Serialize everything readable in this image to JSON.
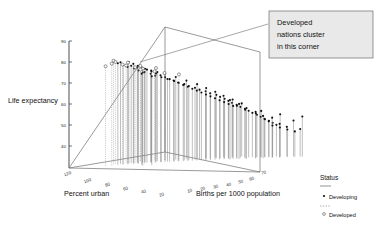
{
  "chart_data": {
    "type": "scatter",
    "subtype": "3d-spike-scatter",
    "title": "",
    "xlabel": "Births per 1000 population",
    "ylabel": "Life expectancy",
    "zlabel": "Percent urban",
    "grid": false,
    "axes": {
      "life_expectancy": {
        "label": "Life expectancy",
        "ticks": [
          90,
          80,
          70,
          60,
          50,
          40,
          30
        ],
        "range": [
          30,
          90
        ]
      },
      "percent_urban": {
        "label": "Percent urban",
        "ticks": [
          120,
          100,
          80,
          60,
          40,
          20
        ],
        "range": [
          0,
          120
        ]
      },
      "births_per_1000": {
        "label": "Births per 1000 population",
        "ticks": [
          10,
          20,
          30,
          40,
          50,
          60,
          70
        ],
        "range": [
          5,
          70
        ]
      }
    },
    "legend": {
      "position": "right",
      "title": "Status",
      "entries": [
        {
          "name": "Developing",
          "marker": "filled-dot",
          "line": "solid",
          "color": "#111111"
        },
        {
          "name": "Developed",
          "marker": "open-circle",
          "line": "dashed",
          "color": "#333333"
        }
      ]
    },
    "annotations": [
      {
        "text": "Developed nations cluster in this corner",
        "target_x": 140,
        "target_y": 62
      }
    ],
    "series": [
      {
        "name": "Developed",
        "marker": "open-circle",
        "points": [
          {
            "births": 13,
            "urban": 96,
            "life": 78
          },
          {
            "births": 12,
            "urban": 90,
            "life": 79
          },
          {
            "births": 14,
            "urban": 86,
            "life": 77
          },
          {
            "births": 11,
            "urban": 84,
            "life": 78
          },
          {
            "births": 13,
            "urban": 78,
            "life": 76
          },
          {
            "births": 15,
            "urban": 74,
            "life": 75
          },
          {
            "births": 12,
            "urban": 72,
            "life": 77
          },
          {
            "births": 16,
            "urban": 68,
            "life": 74
          },
          {
            "births": 14,
            "urban": 64,
            "life": 75
          },
          {
            "births": 13,
            "urban": 60,
            "life": 73
          },
          {
            "births": 17,
            "urban": 57,
            "life": 72
          },
          {
            "births": 12,
            "urban": 100,
            "life": 77
          },
          {
            "births": 19,
            "urban": 52,
            "life": 71
          },
          {
            "births": 15,
            "urban": 48,
            "life": 73
          },
          {
            "births": 22,
            "urban": 45,
            "life": 70
          }
        ]
      },
      {
        "name": "Developing",
        "marker": "filled-dot",
        "points": [
          {
            "births": 14,
            "urban": 92,
            "life": 78
          },
          {
            "births": 15,
            "urban": 89,
            "life": 77
          },
          {
            "births": 16,
            "urban": 87,
            "life": 76
          },
          {
            "births": 13,
            "urban": 85,
            "life": 78
          },
          {
            "births": 17,
            "urban": 83,
            "life": 75
          },
          {
            "births": 18,
            "urban": 81,
            "life": 74
          },
          {
            "births": 15,
            "urban": 79,
            "life": 76
          },
          {
            "births": 19,
            "urban": 77,
            "life": 73
          },
          {
            "births": 16,
            "urban": 75,
            "life": 75
          },
          {
            "births": 20,
            "urban": 73,
            "life": 72
          },
          {
            "births": 21,
            "urban": 71,
            "life": 71
          },
          {
            "births": 17,
            "urban": 69,
            "life": 74
          },
          {
            "births": 22,
            "urban": 67,
            "life": 70
          },
          {
            "births": 18,
            "urban": 65,
            "life": 73
          },
          {
            "births": 23,
            "urban": 63,
            "life": 69
          },
          {
            "births": 19,
            "urban": 61,
            "life": 72
          },
          {
            "births": 24,
            "urban": 59,
            "life": 68
          },
          {
            "births": 25,
            "urban": 57,
            "life": 67
          },
          {
            "births": 20,
            "urban": 55,
            "life": 71
          },
          {
            "births": 26,
            "urban": 53,
            "life": 66
          },
          {
            "births": 27,
            "urban": 51,
            "life": 65
          },
          {
            "births": 22,
            "urban": 49,
            "life": 69
          },
          {
            "births": 28,
            "urban": 47,
            "life": 64
          },
          {
            "births": 29,
            "urban": 45,
            "life": 63
          },
          {
            "births": 24,
            "urban": 43,
            "life": 67
          },
          {
            "births": 30,
            "urban": 41,
            "life": 62
          },
          {
            "births": 31,
            "urban": 39,
            "life": 61
          },
          {
            "births": 26,
            "urban": 37,
            "life": 65
          },
          {
            "births": 32,
            "urban": 35,
            "life": 60
          },
          {
            "births": 33,
            "urban": 34,
            "life": 59
          },
          {
            "births": 28,
            "urban": 33,
            "life": 63
          },
          {
            "births": 34,
            "urban": 32,
            "life": 58
          },
          {
            "births": 35,
            "urban": 31,
            "life": 57
          },
          {
            "births": 36,
            "urban": 30,
            "life": 56
          },
          {
            "births": 30,
            "urban": 29,
            "life": 61
          },
          {
            "births": 37,
            "urban": 28,
            "life": 55
          },
          {
            "births": 38,
            "urban": 27,
            "life": 54
          },
          {
            "births": 32,
            "urban": 26,
            "life": 59
          },
          {
            "births": 39,
            "urban": 25,
            "life": 53
          },
          {
            "births": 40,
            "urban": 24,
            "life": 52
          },
          {
            "births": 41,
            "urban": 23,
            "life": 51
          },
          {
            "births": 34,
            "urban": 22,
            "life": 57
          },
          {
            "births": 42,
            "urban": 21,
            "life": 50
          },
          {
            "births": 43,
            "urban": 20,
            "life": 49
          },
          {
            "births": 44,
            "urban": 19,
            "life": 48
          },
          {
            "births": 36,
            "urban": 18,
            "life": 55
          },
          {
            "births": 45,
            "urban": 17,
            "life": 47
          },
          {
            "births": 46,
            "urban": 16,
            "life": 46
          },
          {
            "births": 47,
            "urban": 15,
            "life": 45
          },
          {
            "births": 48,
            "urban": 14,
            "life": 50
          },
          {
            "births": 50,
            "urban": 13,
            "life": 44
          },
          {
            "births": 52,
            "urban": 12,
            "life": 47
          },
          {
            "births": 54,
            "urban": 11,
            "life": 43
          },
          {
            "births": 38,
            "urban": 40,
            "life": 58
          },
          {
            "births": 40,
            "urban": 36,
            "life": 56
          },
          {
            "births": 42,
            "urban": 34,
            "life": 54
          },
          {
            "births": 44,
            "urban": 30,
            "life": 52
          },
          {
            "births": 46,
            "urban": 28,
            "life": 50
          },
          {
            "births": 48,
            "urban": 24,
            "life": 49
          },
          {
            "births": 50,
            "urban": 22,
            "life": 46
          },
          {
            "births": 25,
            "urban": 62,
            "life": 68
          },
          {
            "births": 27,
            "urban": 58,
            "life": 66
          },
          {
            "births": 29,
            "urban": 54,
            "life": 64
          },
          {
            "births": 31,
            "urban": 50,
            "life": 62
          },
          {
            "births": 33,
            "urban": 46,
            "life": 60
          },
          {
            "births": 35,
            "urban": 42,
            "life": 58
          },
          {
            "births": 37,
            "urban": 38,
            "life": 56
          },
          {
            "births": 23,
            "urban": 66,
            "life": 70
          },
          {
            "births": 21,
            "urban": 70,
            "life": 72
          },
          {
            "births": 19,
            "urban": 74,
            "life": 74
          },
          {
            "births": 43,
            "urban": 26,
            "life": 51
          },
          {
            "births": 45,
            "urban": 22,
            "life": 48
          },
          {
            "births": 47,
            "urban": 20,
            "life": 45
          },
          {
            "births": 49,
            "urban": 18,
            "life": 44
          },
          {
            "births": 51,
            "urban": 16,
            "life": 43
          },
          {
            "births": 53,
            "urban": 14,
            "life": 42
          },
          {
            "births": 55,
            "urban": 12,
            "life": 49
          },
          {
            "births": 41,
            "urban": 32,
            "life": 53
          },
          {
            "births": 39,
            "urban": 35,
            "life": 55
          },
          {
            "births": 28,
            "urban": 56,
            "life": 65
          },
          {
            "births": 26,
            "urban": 60,
            "life": 67
          },
          {
            "births": 24,
            "urban": 64,
            "life": 69
          },
          {
            "births": 22,
            "urban": 68,
            "life": 71
          },
          {
            "births": 20,
            "urban": 72,
            "life": 73
          },
          {
            "births": 18,
            "urban": 76,
            "life": 75
          },
          {
            "births": 16,
            "urban": 80,
            "life": 77
          },
          {
            "births": 15,
            "urban": 82,
            "life": 78
          },
          {
            "births": 17,
            "urban": 78,
            "life": 76
          },
          {
            "births": 30,
            "urban": 52,
            "life": 63
          },
          {
            "births": 32,
            "urban": 48,
            "life": 61
          },
          {
            "births": 34,
            "urban": 44,
            "life": 59
          },
          {
            "births": 36,
            "urban": 40,
            "life": 57
          },
          {
            "births": 38,
            "urban": 36,
            "life": 55
          },
          {
            "births": 44,
            "urban": 23,
            "life": 52
          },
          {
            "births": 46,
            "urban": 21,
            "life": 47
          },
          {
            "births": 25,
            "urban": 90,
            "life": 72
          },
          {
            "births": 23,
            "urban": 94,
            "life": 74
          },
          {
            "births": 21,
            "urban": 88,
            "life": 73
          }
        ]
      }
    ]
  },
  "labels": {
    "y_axis": "Life expectancy",
    "z_axis": "Percent urban",
    "x_axis": "Births per 1000 population"
  },
  "legend": {
    "title": "Status",
    "developing": "Developing",
    "developed": "Developed"
  },
  "callout": {
    "line1": "Developed",
    "line2": "nations cluster",
    "line3": "in this corner"
  },
  "ticks": {
    "life": [
      "90",
      "80",
      "70",
      "60",
      "50",
      "40"
    ],
    "urban": [
      "120",
      "100",
      "80",
      "60",
      "40",
      "20"
    ],
    "births": [
      "10",
      "20",
      "30",
      "40",
      "50",
      "60",
      "70"
    ]
  }
}
